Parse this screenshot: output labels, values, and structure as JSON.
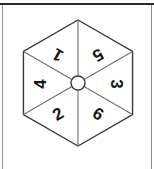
{
  "figure": {
    "kind": "hexagonal-spinner",
    "border": {
      "top_rule_color": "#2b2b2b",
      "side_rule_color": "#8d8d8d"
    },
    "geometry": {
      "center_x": 78,
      "center_y": 83,
      "circumradius": 63,
      "pivot_radius": 7,
      "top_vertex_y": 20,
      "bottom_vertex_y": 146,
      "left_vertex_x": 19,
      "right_vertex_x": 137,
      "outline_color": "#3a3a3a",
      "spoke_color": "#6e6e6e",
      "pivot_color": "#3a3a3a",
      "fill_color": "#ffffff"
    },
    "sectors": [
      {
        "label": "1",
        "position": "upper-left",
        "center_angle_deg": -120,
        "label_rotation_deg": -150,
        "label_x": 58,
        "label_y": 55
      },
      {
        "label": "5",
        "position": "upper-right",
        "center_angle_deg": -60,
        "label_rotation_deg": 150,
        "label_x": 98,
        "label_y": 55
      },
      {
        "label": "3",
        "position": "right",
        "center_angle_deg": 0,
        "label_rotation_deg": 90,
        "label_x": 116,
        "label_y": 84
      },
      {
        "label": "6",
        "position": "lower-right",
        "center_angle_deg": 60,
        "label_rotation_deg": 30,
        "label_x": 98,
        "label_y": 114
      },
      {
        "label": "2",
        "position": "lower-left",
        "center_angle_deg": 120,
        "label_rotation_deg": -30,
        "label_x": 58,
        "label_y": 114
      },
      {
        "label": "4",
        "position": "left",
        "center_angle_deg": 180,
        "label_rotation_deg": -90,
        "label_x": 40,
        "label_y": 84
      }
    ],
    "sector_order_clockwise_from_top_left": [
      "1",
      "5",
      "3",
      "6",
      "2",
      "4"
    ]
  }
}
